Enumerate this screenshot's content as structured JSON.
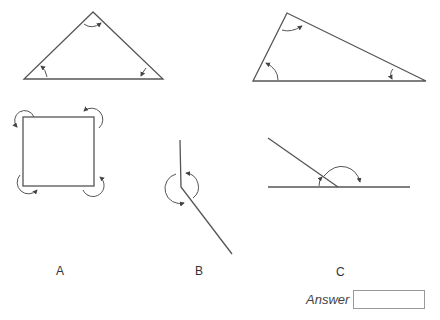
{
  "figures": {
    "labels": [
      "A",
      "B",
      "C"
    ]
  },
  "answer": {
    "label": "Answer",
    "value": ""
  },
  "colors": {
    "line": "#555555",
    "text": "#333333"
  }
}
